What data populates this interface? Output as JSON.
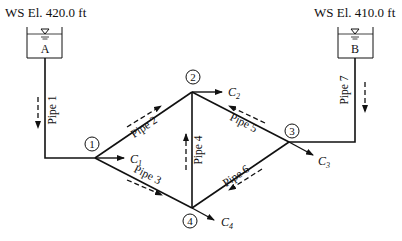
{
  "reservoirs": [
    {
      "id": "A",
      "label": "A",
      "elevation_label": "WS El. 420.0 ft"
    },
    {
      "id": "B",
      "label": "B",
      "elevation_label": "WS El. 410.0 ft"
    }
  ],
  "nodes": [
    {
      "id": "1",
      "label": "1",
      "outflow": "C",
      "outflow_sub": "1"
    },
    {
      "id": "2",
      "label": "2",
      "outflow": "C",
      "outflow_sub": "2"
    },
    {
      "id": "3",
      "label": "3",
      "outflow": "C",
      "outflow_sub": "3"
    },
    {
      "id": "4",
      "label": "4",
      "outflow": "C",
      "outflow_sub": "4"
    }
  ],
  "pipes": [
    {
      "id": "1",
      "label": "Pipe 1",
      "from": "A",
      "to": "1"
    },
    {
      "id": "2",
      "label": "Pipe 2",
      "from": "1",
      "to": "2"
    },
    {
      "id": "3",
      "label": "Pipe 3",
      "from": "1",
      "to": "4"
    },
    {
      "id": "4",
      "label": "Pipe 4",
      "from": "4",
      "to": "2"
    },
    {
      "id": "5",
      "label": "Pipe 5",
      "from": "3",
      "to": "2"
    },
    {
      "id": "6",
      "label": "Pipe 6",
      "from": "3",
      "to": "4"
    },
    {
      "id": "7",
      "label": "Pipe 7",
      "from": "B",
      "to": "3"
    }
  ]
}
